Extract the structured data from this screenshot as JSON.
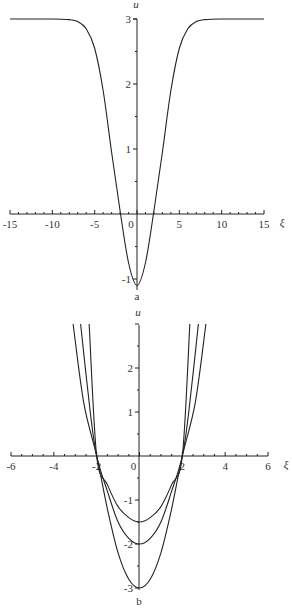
{
  "chart_data": [
    {
      "type": "line",
      "panel_label": "a",
      "title": "",
      "xlabel": "ξ",
      "ylabel": "u",
      "xlim": [
        -15,
        15
      ],
      "ylim": [
        -1.1,
        3
      ],
      "xticks": [
        -15,
        -10,
        -5,
        0,
        5,
        10,
        15
      ],
      "yticks": [
        -1,
        1,
        2,
        3
      ],
      "grid": false,
      "legend": null,
      "series": [
        {
          "name": "u(ξ)",
          "x": [
            -15,
            -10,
            -8,
            -7,
            -6,
            -5,
            -4,
            -3,
            -2,
            -1,
            0,
            1,
            2,
            3,
            4,
            5,
            6,
            7,
            8,
            10,
            15
          ],
          "y": [
            3,
            3,
            2.99,
            2.96,
            2.85,
            2.55,
            1.9,
            0.95,
            0.05,
            -0.75,
            -1.1,
            -0.75,
            0.05,
            0.95,
            1.9,
            2.55,
            2.85,
            2.96,
            2.99,
            3,
            3
          ]
        }
      ]
    },
    {
      "type": "line",
      "panel_label": "b",
      "title": "",
      "xlabel": "ξ",
      "ylabel": "u",
      "xlim": [
        -6,
        6
      ],
      "ylim": [
        -3,
        3
      ],
      "xticks": [
        -6,
        -4,
        -2,
        0,
        2,
        4,
        6
      ],
      "yticks": [
        -3,
        -2,
        -1,
        1,
        2
      ],
      "grid": false,
      "legend": null,
      "series": [
        {
          "name": "min -1.5",
          "x": [
            -2.35,
            -2,
            -1.5,
            -1,
            -0.5,
            0,
            0.5,
            1,
            1.5,
            2,
            2.35
          ],
          "y": [
            3,
            0,
            -0.65,
            -1.15,
            -1.4,
            -1.5,
            -1.4,
            -1.15,
            -0.65,
            0,
            3
          ]
        },
        {
          "name": "min -2",
          "x": [
            -2.75,
            -2.3,
            -2,
            -1.5,
            -1,
            -0.5,
            0,
            0.5,
            1,
            1.5,
            2,
            2.3,
            2.75
          ],
          "y": [
            3,
            1.0,
            0,
            -0.8,
            -1.5,
            -1.87,
            -2,
            -1.87,
            -1.5,
            -0.8,
            0,
            1.0,
            3
          ]
        },
        {
          "name": "min -3",
          "x": [
            -3.1,
            -2.6,
            -2,
            -1.5,
            -1,
            -0.5,
            0,
            0.5,
            1,
            1.5,
            2,
            2.6,
            3.1
          ],
          "y": [
            3,
            1.2,
            0,
            -1.2,
            -2.2,
            -2.8,
            -3,
            -2.8,
            -2.2,
            -1.2,
            0,
            1.2,
            3
          ]
        }
      ]
    }
  ]
}
